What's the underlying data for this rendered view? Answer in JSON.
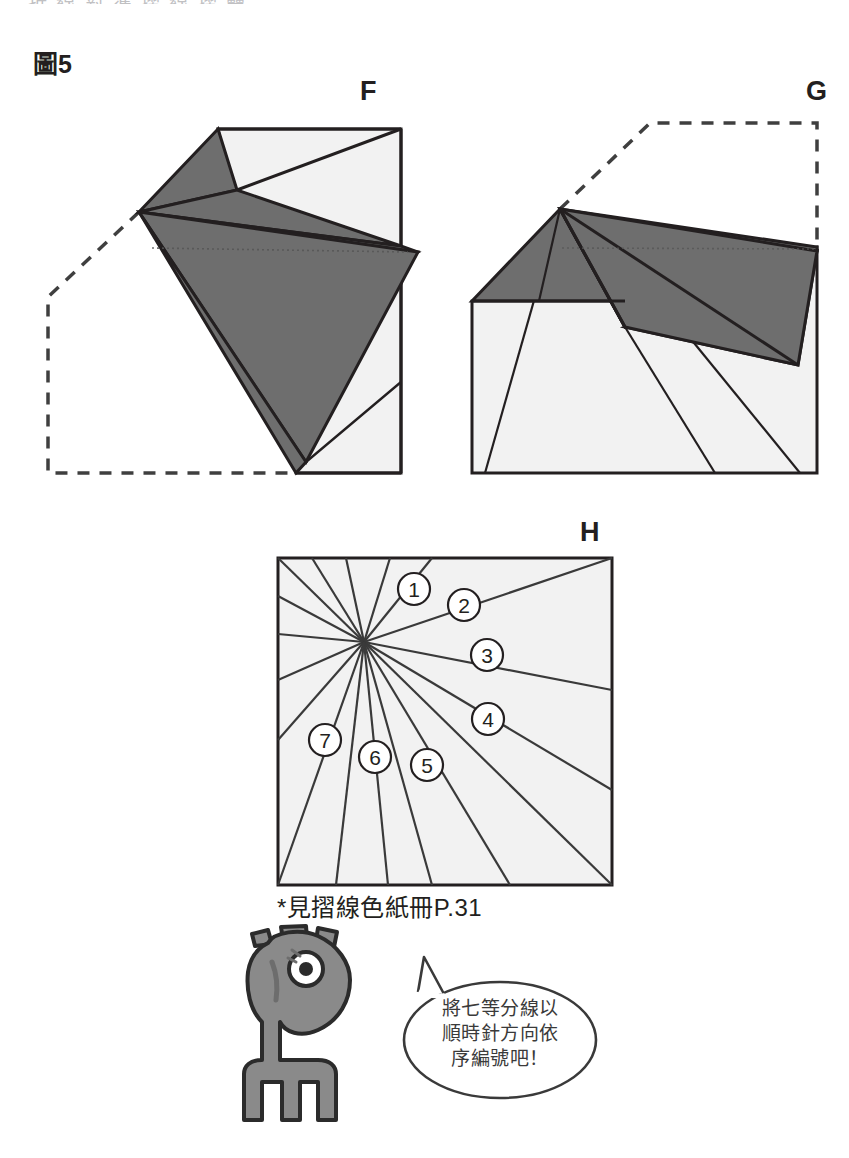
{
  "page": {
    "figure_number": "圖5",
    "top_clipped_text": "折 線 對 準 摺 線 摺 疊"
  },
  "panels": [
    {
      "id": "F",
      "letter": "F"
    },
    {
      "id": "G",
      "letter": "G"
    },
    {
      "id": "H",
      "letter": "H"
    }
  ],
  "panel_h": {
    "letter": "H",
    "numbers": [
      "1",
      "2",
      "3",
      "4",
      "5",
      "6",
      "7"
    ]
  },
  "caption": {
    "text": "*見摺線色紙冊P.31"
  },
  "speech_bubble": {
    "line1": "將七等分線以",
    "line2": "順時針方向依",
    "line3": "序編號吧！"
  },
  "colors": {
    "paper_light": "#f2f2f2",
    "paper_dark": "#6e6e6e",
    "outline": "#231f20",
    "thin_line": "#3a3a3a",
    "mascot_body": "#8a8a8a",
    "mascot_outline": "#2b2b2b",
    "background": "#ffffff"
  }
}
